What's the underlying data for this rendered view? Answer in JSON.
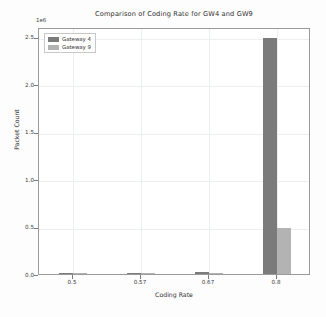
{
  "chart_data": {
    "type": "bar",
    "title": "Comparison of Coding Rate for GW4 and GW9",
    "xlabel": "Coding Rate",
    "ylabel": "Packet Count",
    "offset_label": "1e6",
    "categories": [
      "0.5",
      "0.57",
      "0.67",
      "0.8"
    ],
    "series": [
      {
        "name": "Gateway 4",
        "color": "#7b7b7b",
        "values": [
          0.004,
          0.002,
          0.018,
          2.48
        ]
      },
      {
        "name": "Gateway 9",
        "color": "#b3b3b3",
        "values": [
          0.002,
          0.001,
          0.006,
          0.48
        ]
      }
    ],
    "ylim": [
      0.0,
      2.6
    ],
    "yticks": [
      "0.0",
      "0.5",
      "1.0",
      "1.5",
      "2.0",
      "2.5"
    ],
    "ytick_values": [
      0.0,
      0.5,
      1.0,
      1.5,
      2.0,
      2.5
    ],
    "xticks": [
      "0.5",
      "0.57",
      "0.67",
      "0.8"
    ],
    "grid": true,
    "legend_position": "upper left"
  }
}
